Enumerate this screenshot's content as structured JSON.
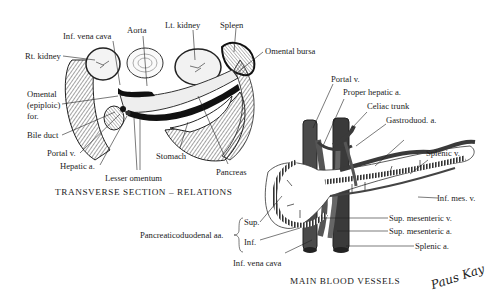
{
  "figure_left": {
    "caption": "TRANSVERSE SECTION – RELATIONS",
    "labels": {
      "rt_kidney": "Rt. kidney",
      "inf_vena_cava": "Inf. vena cava",
      "aorta": "Aorta",
      "lt_kidney": "Lt. kidney",
      "spleen": "Spleen",
      "omental_bursa": "Omental bursa",
      "omental_for_1": "Omental",
      "omental_for_2": "(epiploic)",
      "omental_for_3": "for.",
      "bile_duct": "Bile duct",
      "portal_v": "Portal v.",
      "hepatic_a": "Hepatic a.",
      "lesser_omentum": "Lesser omentum",
      "stomach": "Stomach",
      "pancreas": "Pancreas"
    }
  },
  "figure_right": {
    "caption": "MAIN BLOOD VESSELS",
    "labels": {
      "portal_v": "Portal v.",
      "proper_hepatic_a": "Proper hepatic a.",
      "celiac_trunk": "Celiac trunk",
      "gastroduod_a": "Gastroduod. a.",
      "splenic_v": "Splenic v.",
      "inf_mes_v": "Inf. mes. v.",
      "sup_mesenteric_v": "Sup. mesenteric v.",
      "sup_mesenteric_a": "Sup. mesenteric a.",
      "splenic_a": "Splenic a.",
      "inf_vena_cava": "Inf. vena cava",
      "pancreaticoduodenal": "Pancreaticoduodenal aa.",
      "sup": "Sup.",
      "inf": "Inf."
    }
  },
  "signature": "Paus Kay",
  "colors": {
    "ink": "#222222",
    "vessel_dark": "#3a3a3a",
    "vessel_mid": "#6a6a6a",
    "paper": "#ffffff"
  }
}
